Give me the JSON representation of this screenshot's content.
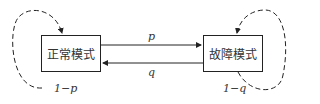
{
  "diagram": {
    "nodes": [
      {
        "id": "normal",
        "label": "正常模式"
      },
      {
        "id": "fault",
        "label": "故障模式"
      }
    ],
    "edges": [
      {
        "from": "normal",
        "to": "fault",
        "label": "p"
      },
      {
        "from": "fault",
        "to": "normal",
        "label": "q"
      },
      {
        "from": "normal",
        "to": "normal",
        "label": "1−p",
        "style": "dashed"
      },
      {
        "from": "fault",
        "to": "fault",
        "label": "1−q",
        "style": "dashed"
      }
    ]
  }
}
